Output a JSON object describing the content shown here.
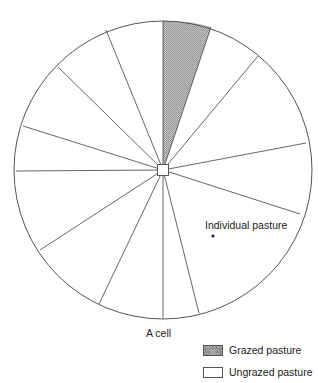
{
  "diagram": {
    "title": "A cell",
    "center": [
      163,
      170
    ],
    "radius": 149,
    "hub_size": 11,
    "stroke_color": "#555555",
    "grazed_fill": "#bdbdbd",
    "spokes": [
      [
        163,
        21
      ],
      [
        211,
        27
      ],
      [
        258,
        56
      ],
      [
        306,
        143
      ],
      [
        300,
        214
      ],
      [
        199,
        313
      ],
      [
        163,
        318
      ],
      [
        99,
        304
      ],
      [
        40,
        250
      ],
      [
        16,
        171
      ],
      [
        23,
        126
      ],
      [
        58,
        67
      ],
      [
        106,
        30
      ]
    ],
    "grazed_segment": {
      "from_spoke": 0,
      "to_spoke": 1
    },
    "labels": {
      "individual_pasture": "Individual pasture",
      "cell": "A cell"
    },
    "pasture_marker": [
      213,
      236
    ]
  },
  "legend": {
    "items": [
      {
        "key": "grazed",
        "label": "Grazed pasture"
      },
      {
        "key": "ungrazed",
        "label": "Ungrazed pasture"
      }
    ]
  }
}
